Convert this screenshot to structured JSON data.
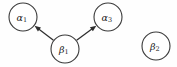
{
  "diagram": {
    "background_color": "#fefefe",
    "node_stroke_color": "#3a3a3a",
    "edge_color": "#2e2e2e",
    "label_color": "#1d1d1d",
    "nodes": [
      {
        "id": "alpha1",
        "greek": "α",
        "subscript": "1",
        "label": "α1",
        "cx": 23,
        "cy": 17,
        "r": 14
      },
      {
        "id": "alpha3",
        "greek": "α",
        "subscript": "3",
        "label": "α3",
        "cx": 108,
        "cy": 17,
        "r": 14
      },
      {
        "id": "beta1",
        "greek": "β",
        "subscript": "1",
        "label": "β1",
        "cx": 65,
        "cy": 49,
        "r": 14
      },
      {
        "id": "beta2",
        "greek": "β",
        "subscript": "2",
        "label": "β2",
        "cx": 156,
        "cy": 46,
        "r": 14
      }
    ],
    "edges": [
      {
        "id": "edge-beta1-alpha1",
        "from": "beta1",
        "to": "alpha1",
        "directed": true,
        "x1": 54,
        "y1": 41,
        "x2": 34,
        "y2": 25
      },
      {
        "id": "edge-beta1-alpha3",
        "from": "beta1",
        "to": "alpha3",
        "directed": true,
        "x1": 77,
        "y1": 41,
        "x2": 97,
        "y2": 25
      }
    ]
  }
}
